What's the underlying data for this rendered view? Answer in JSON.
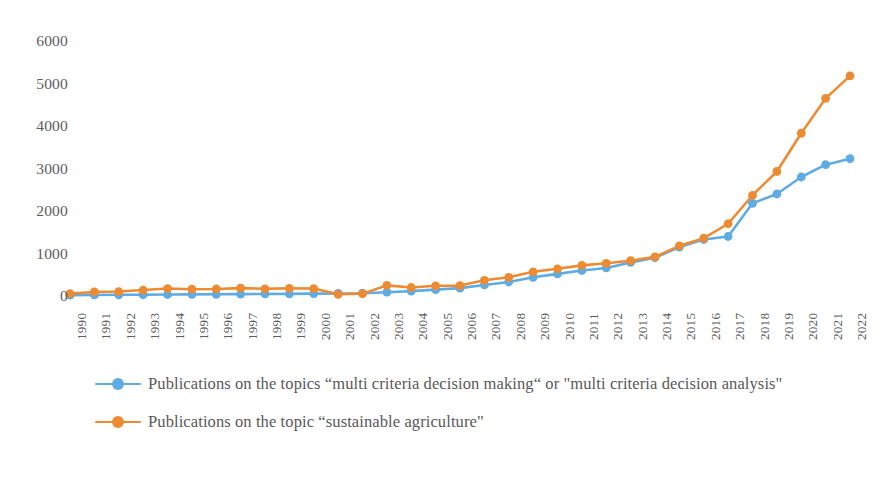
{
  "chart_data": {
    "type": "line",
    "title": "",
    "xlabel": "",
    "ylabel": "",
    "grid": false,
    "legend_position": "bottom-left",
    "ylim": [
      0,
      6000
    ],
    "yticks": [
      0,
      1000,
      2000,
      3000,
      4000,
      5000,
      6000
    ],
    "ytick_labels": [
      "0",
      "1000",
      "2000",
      "3000",
      "4000",
      "5000",
      "6000"
    ],
    "categories": [
      "1990",
      "1991",
      "1992",
      "1993",
      "1994",
      "1995",
      "1996",
      "1997",
      "1998",
      "1999",
      "2000",
      "2001",
      "2002",
      "2003",
      "2004",
      "2005",
      "2006",
      "2007",
      "2008",
      "2009",
      "2010",
      "2011",
      "2012",
      "2013",
      "2014",
      "2015",
      "2016",
      "2017",
      "2018",
      "2019",
      "2020",
      "2021",
      "2022"
    ],
    "series": [
      {
        "name": "Publications on the topics “multi criteria decision making“  or \"multi criteria decision analysis\"",
        "color": "#5FACE4",
        "marker": "circle",
        "values": [
          20,
          25,
          28,
          30,
          35,
          38,
          40,
          45,
          48,
          50,
          55,
          60,
          65,
          90,
          115,
          150,
          185,
          260,
          330,
          440,
          520,
          600,
          660,
          790,
          900,
          1150,
          1330,
          1400,
          2180,
          2400,
          2800,
          3090,
          3230
        ]
      },
      {
        "name": "Publications on the topic “sustainable agriculture\"",
        "color": "#ED8B33",
        "marker": "circle",
        "values": [
          55,
          95,
          105,
          140,
          175,
          160,
          165,
          185,
          170,
          180,
          175,
          40,
          55,
          250,
          200,
          240,
          245,
          370,
          440,
          570,
          640,
          720,
          770,
          830,
          920,
          1180,
          1360,
          1700,
          2370,
          2930,
          3830,
          4650,
          5180
        ]
      }
    ]
  },
  "legend": {
    "items": [
      {
        "label": "Publications on the topics “multi criteria decision making“  or \"multi criteria decision analysis\"",
        "color": "#5FACE4"
      },
      {
        "label": "Publications on the topic “sustainable agriculture\"",
        "color": "#ED8B33"
      }
    ]
  }
}
